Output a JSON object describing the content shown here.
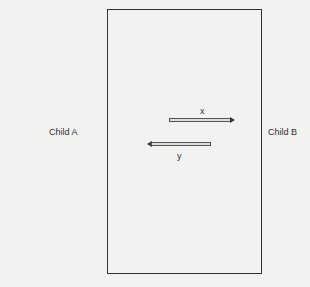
{
  "diagram": {
    "left_label": "Child A",
    "right_label": "Child B",
    "arrows": [
      {
        "label": "x",
        "direction": "right"
      },
      {
        "label": "y",
        "direction": "left"
      }
    ]
  }
}
